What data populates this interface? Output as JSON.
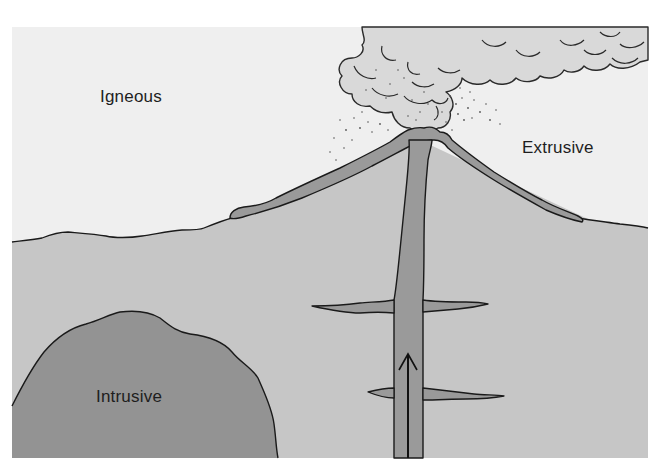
{
  "diagram": {
    "labels": {
      "igneous": "Igneous",
      "extrusive": "Extrusive",
      "intrusive": "Intrusive"
    },
    "elements": [
      "sky",
      "ash-cloud",
      "ash-particles",
      "ground",
      "volcano-cone",
      "lava-flow-layer",
      "magma-conduit",
      "sills",
      "intrusive-pluton",
      "upward-magma-arrow"
    ],
    "colors": {
      "page_bg": "#ffffff",
      "sky": "#efefef",
      "cloud": "#d9d9d9",
      "ground": "#c6c6c6",
      "lava": "#9a9a9a",
      "pluton": "#939393",
      "outline": "#1a1a1a",
      "text": "#1e1e1e"
    }
  }
}
